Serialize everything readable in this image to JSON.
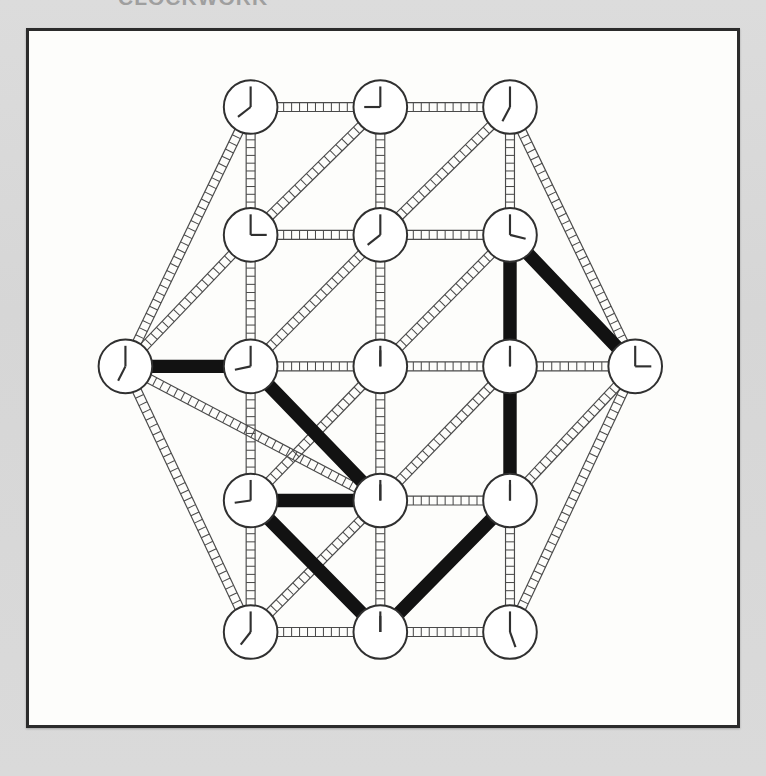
{
  "scan": {
    "clipped_header_text": "CLOCKWORK",
    "background_color": "#d8d8d8",
    "panel_background": "#fdfdfb",
    "panel_border_color": "#2b2b2b",
    "ink_color": "#303030",
    "highlight_color": "#121212"
  },
  "figure": {
    "caption": "",
    "panel": {
      "x": 26,
      "y": 28,
      "width": 714,
      "height": 700
    }
  },
  "chart_data": {
    "type": "diagram",
    "node_shape": "clock-face",
    "node_radius": 30,
    "edge_style": "ladder",
    "nodes": [
      {
        "id": "n1",
        "label": "top-left-clock",
        "x": 235,
        "y": 85,
        "hour_hand_deg": 232,
        "minute_hand_deg": 0,
        "time": "12:44"
      },
      {
        "id": "n2",
        "label": "top-center-clock",
        "x": 380,
        "y": 85,
        "hour_hand_deg": 270,
        "minute_hand_deg": 0,
        "time": "12:45"
      },
      {
        "id": "n3",
        "label": "top-right-clock",
        "x": 525,
        "y": 85,
        "hour_hand_deg": 208,
        "minute_hand_deg": 0,
        "time": "12:42"
      },
      {
        "id": "n4",
        "label": "upper-left-clock",
        "x": 235,
        "y": 228,
        "hour_hand_deg": 90,
        "minute_hand_deg": 0,
        "time": "12:15"
      },
      {
        "id": "n5",
        "label": "upper-center-clock",
        "x": 380,
        "y": 228,
        "hour_hand_deg": 232,
        "minute_hand_deg": 0,
        "time": "12:44"
      },
      {
        "id": "n6",
        "label": "upper-right-clock",
        "x": 525,
        "y": 228,
        "hour_hand_deg": 104,
        "minute_hand_deg": 0,
        "time": "12:17"
      },
      {
        "id": "n7",
        "label": "far-left-clock",
        "x": 95,
        "y": 375,
        "hour_hand_deg": 207,
        "minute_hand_deg": 0,
        "time": "12:41"
      },
      {
        "id": "n8",
        "label": "mid-left-clock",
        "x": 235,
        "y": 375,
        "hour_hand_deg": 258,
        "minute_hand_deg": 0,
        "time": "12:43"
      },
      {
        "id": "n9",
        "label": "center-clock",
        "x": 380,
        "y": 375,
        "hour_hand_deg": 0,
        "minute_hand_deg": 0,
        "time": "12:00"
      },
      {
        "id": "n10",
        "label": "mid-right-clock",
        "x": 525,
        "y": 375,
        "hour_hand_deg": 0,
        "minute_hand_deg": 0,
        "time": "12:00"
      },
      {
        "id": "n11",
        "label": "far-right-clock",
        "x": 665,
        "y": 375,
        "hour_hand_deg": 90,
        "minute_hand_deg": 0,
        "time": "12:15"
      },
      {
        "id": "n12",
        "label": "lower-left-clock",
        "x": 235,
        "y": 525,
        "hour_hand_deg": 262,
        "minute_hand_deg": 0,
        "time": "12:44"
      },
      {
        "id": "n13",
        "label": "lower-center-clock",
        "x": 380,
        "y": 525,
        "hour_hand_deg": 0,
        "minute_hand_deg": 0,
        "time": "12:00"
      },
      {
        "id": "n14",
        "label": "lower-right-clock",
        "x": 525,
        "y": 525,
        "hour_hand_deg": 0,
        "minute_hand_deg": 0,
        "time": "12:00"
      },
      {
        "id": "n15",
        "label": "bottom-left-clock",
        "x": 235,
        "y": 672,
        "hour_hand_deg": 218,
        "minute_hand_deg": 0,
        "time": "12:43"
      },
      {
        "id": "n16",
        "label": "bottom-center-clock",
        "x": 380,
        "y": 672,
        "hour_hand_deg": 0,
        "minute_hand_deg": 0,
        "time": "12:00"
      },
      {
        "id": "n17",
        "label": "bottom-right-clock",
        "x": 525,
        "y": 672,
        "hour_hand_deg": 160,
        "minute_hand_deg": 0,
        "time": "12:47"
      }
    ],
    "edges": [
      {
        "from": "n1",
        "to": "n2"
      },
      {
        "from": "n2",
        "to": "n3"
      },
      {
        "from": "n1",
        "to": "n4"
      },
      {
        "from": "n2",
        "to": "n5"
      },
      {
        "from": "n3",
        "to": "n6"
      },
      {
        "from": "n4",
        "to": "n5"
      },
      {
        "from": "n5",
        "to": "n6"
      },
      {
        "from": "n2",
        "to": "n4"
      },
      {
        "from": "n3",
        "to": "n5"
      },
      {
        "from": "n1",
        "to": "n7"
      },
      {
        "from": "n3",
        "to": "n11"
      },
      {
        "from": "n4",
        "to": "n7"
      },
      {
        "from": "n6",
        "to": "n11"
      },
      {
        "from": "n4",
        "to": "n8"
      },
      {
        "from": "n5",
        "to": "n9"
      },
      {
        "from": "n6",
        "to": "n10"
      },
      {
        "from": "n5",
        "to": "n8"
      },
      {
        "from": "n6",
        "to": "n9"
      },
      {
        "from": "n7",
        "to": "n8"
      },
      {
        "from": "n8",
        "to": "n9"
      },
      {
        "from": "n9",
        "to": "n10"
      },
      {
        "from": "n10",
        "to": "n11"
      },
      {
        "from": "n8",
        "to": "n12"
      },
      {
        "from": "n9",
        "to": "n13"
      },
      {
        "from": "n10",
        "to": "n14"
      },
      {
        "from": "n9",
        "to": "n12"
      },
      {
        "from": "n10",
        "to": "n13"
      },
      {
        "from": "n7",
        "to": "n13"
      },
      {
        "from": "n11",
        "to": "n14"
      },
      {
        "from": "n12",
        "to": "n13"
      },
      {
        "from": "n13",
        "to": "n14"
      },
      {
        "from": "n12",
        "to": "n15"
      },
      {
        "from": "n13",
        "to": "n16"
      },
      {
        "from": "n14",
        "to": "n17"
      },
      {
        "from": "n13",
        "to": "n15"
      },
      {
        "from": "n14",
        "to": "n16"
      },
      {
        "from": "n7",
        "to": "n15"
      },
      {
        "from": "n11",
        "to": "n17"
      },
      {
        "from": "n15",
        "to": "n16"
      },
      {
        "from": "n16",
        "to": "n17"
      }
    ],
    "highlighted_path": {
      "name": "traversal-path",
      "color": "#121212",
      "stroke_width": 15,
      "node_sequence": [
        "n7",
        "n8",
        "n13",
        "n12",
        "n13",
        "n16",
        "n14",
        "n6",
        "n11"
      ],
      "segments": [
        {
          "from": "n7",
          "to": "n8",
          "x1": 95,
          "y1": 375,
          "x2": 235,
          "y2": 375
        },
        {
          "from": "n8",
          "to": "n13",
          "x1": 235,
          "y1": 375,
          "x2": 380,
          "y2": 525
        },
        {
          "from": "n13",
          "to": "n12",
          "x1": 380,
          "y1": 525,
          "x2": 235,
          "y2": 525
        },
        {
          "from": "n12",
          "to": "n16",
          "x1": 235,
          "y1": 525,
          "x2": 380,
          "y2": 672
        },
        {
          "from": "n16",
          "to": "n14",
          "x1": 380,
          "y1": 672,
          "x2": 525,
          "y2": 525
        },
        {
          "from": "n14",
          "to": "n6",
          "x1": 525,
          "y1": 525,
          "x2": 525,
          "y2": 228
        },
        {
          "from": "n6",
          "to": "n11",
          "x1": 525,
          "y1": 228,
          "x2": 665,
          "y2": 375
        }
      ]
    },
    "legend": [],
    "grid": false
  }
}
